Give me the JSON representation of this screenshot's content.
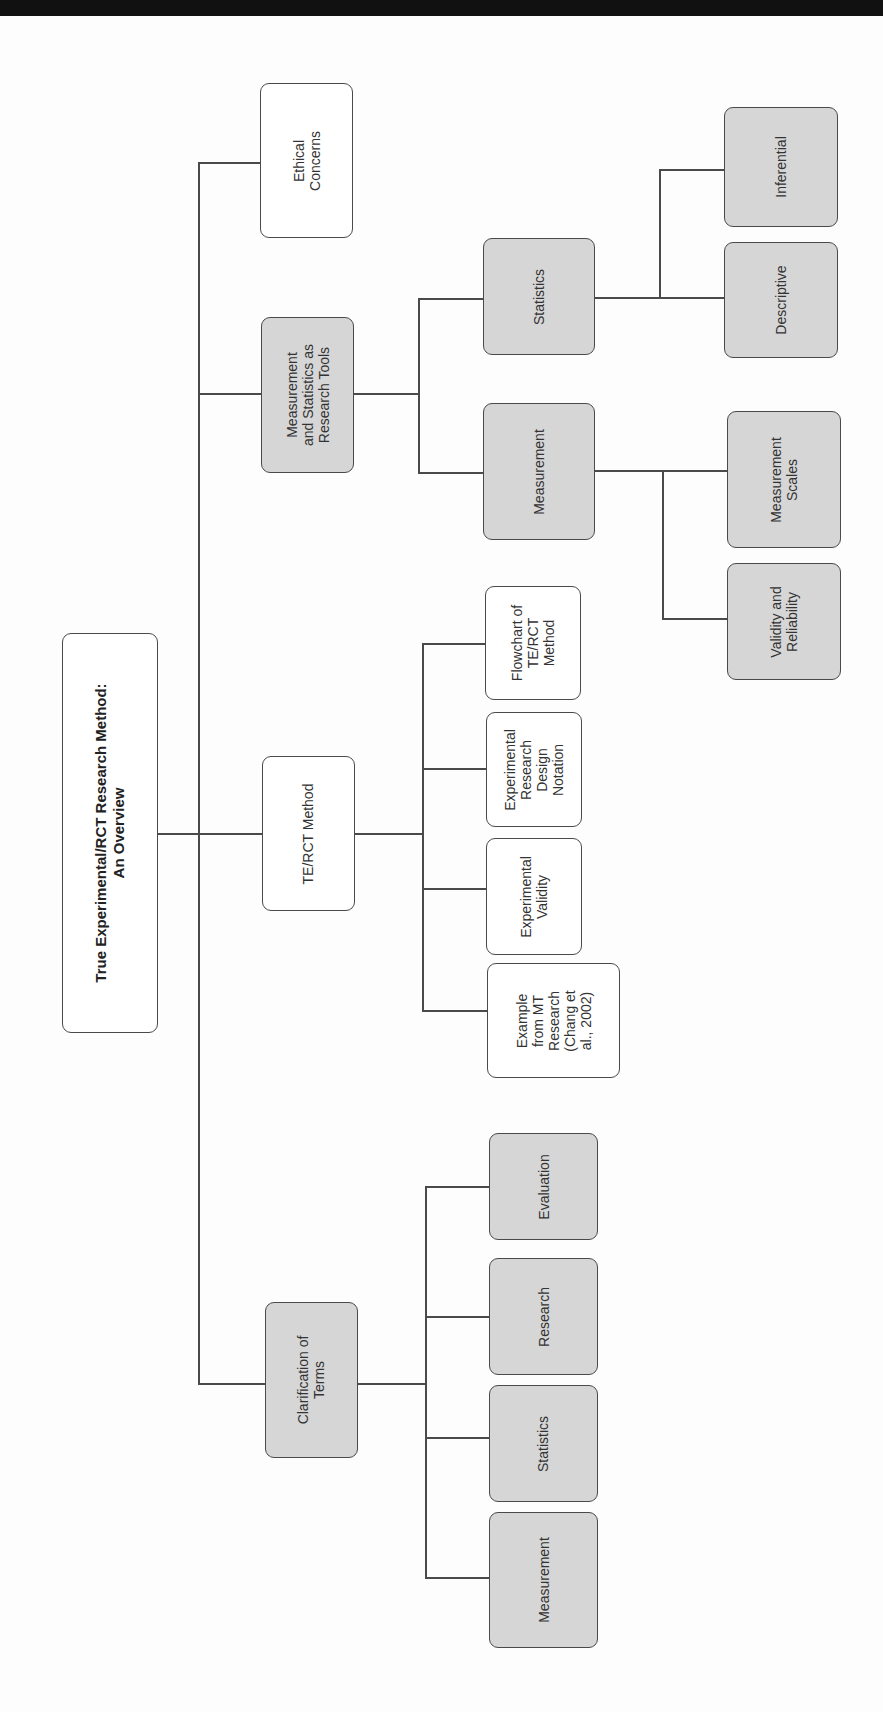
{
  "diagram": {
    "type": "hierarchy-tree",
    "orientation": "rotated-90",
    "root": {
      "label": "True Experimental/RCT Research Method:\nAn Overview",
      "fill": "#ffffff"
    },
    "level1": [
      {
        "label": "Ethical\nConcerns",
        "fill": "#ffffff"
      },
      {
        "label": "Measurement\nand Statistics as\nResearch Tools",
        "fill": "#d6d6d6"
      },
      {
        "label": "TE/RCT Method",
        "fill": "#ffffff"
      },
      {
        "label": "Clarification of\nTerms",
        "fill": "#d6d6d6"
      }
    ],
    "measurement_statistics_children": [
      {
        "label": "Statistics",
        "fill": "#d6d6d6"
      },
      {
        "label": "Measurement",
        "fill": "#d6d6d6"
      }
    ],
    "statistics_children": [
      {
        "label": "Inferential",
        "fill": "#d6d6d6"
      },
      {
        "label": "Descriptive",
        "fill": "#d6d6d6"
      }
    ],
    "measurement_children": [
      {
        "label": "Measurement\nScales",
        "fill": "#d6d6d6"
      },
      {
        "label": "Validity and\nReliability",
        "fill": "#d6d6d6"
      }
    ],
    "te_rct_children": [
      {
        "label": "Flowchart of\nTE/RCT\nMethod",
        "fill": "#ffffff"
      },
      {
        "label": "Experimental\nResearch\nDesign\nNotation",
        "fill": "#ffffff"
      },
      {
        "label": "Experimental\nValidity",
        "fill": "#ffffff"
      },
      {
        "label": "Example\nfrom MT\nResearch\n(Chang et\nal., 2002)",
        "fill": "#ffffff"
      }
    ],
    "clarification_children": [
      {
        "label": "Evaluation",
        "fill": "#d6d6d6"
      },
      {
        "label": "Research",
        "fill": "#d6d6d6"
      },
      {
        "label": "Statistics",
        "fill": "#d6d6d6"
      },
      {
        "label": "Measurement",
        "fill": "#d6d6d6"
      }
    ],
    "colors": {
      "line": "#4a4a4a",
      "gray_fill": "#d6d6d6",
      "white_fill": "#ffffff",
      "top_band": "#111111"
    }
  }
}
